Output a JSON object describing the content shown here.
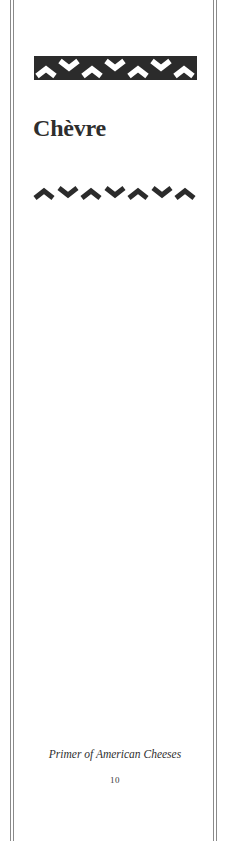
{
  "page": {
    "title": "Chèvre",
    "footer_title": "Primer of American Cheeses",
    "page_number": "10"
  },
  "ornaments": {
    "top_banner": {
      "icon": "chevron-pattern-banner",
      "background": "#2b2b2b",
      "foreground": "#ffffff",
      "pattern": [
        "up",
        "down",
        "up",
        "down",
        "up",
        "down",
        "up"
      ]
    },
    "divider": {
      "icon": "chevron-pattern-divider",
      "color": "#2b2b2b",
      "pattern": [
        "up",
        "down",
        "up",
        "down",
        "up",
        "down",
        "up"
      ]
    }
  },
  "colors": {
    "rule": "#8a8a8a",
    "text": "#2e2e2e",
    "background": "#ffffff"
  }
}
